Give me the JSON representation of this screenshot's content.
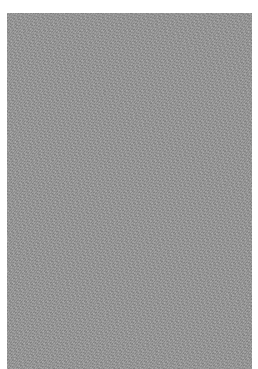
{
  "canvas": {
    "width": 258,
    "height": 369,
    "background": "#ffffff"
  },
  "panel": {
    "description": "gray noise texture",
    "color": "#9a9a9a",
    "left": 7,
    "top": 13,
    "width": 245,
    "height": 356
  }
}
